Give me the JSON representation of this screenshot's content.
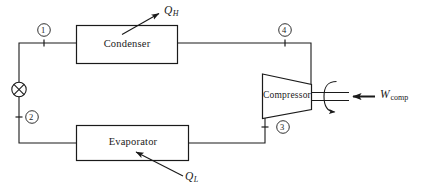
{
  "diagram": {
    "stroke_color": "#1a1a1a",
    "background_color": "#ffffff",
    "components": {
      "condenser": {
        "label": "Condenser"
      },
      "evaporator": {
        "label": "Evaporator"
      },
      "compressor": {
        "label": "Compressor"
      },
      "expansion_valve": {
        "icon": "circle-x-valve-icon"
      }
    },
    "state_points": [
      {
        "id": "1",
        "label": "1"
      },
      {
        "id": "2",
        "label": "2"
      },
      {
        "id": "3",
        "label": "3"
      },
      {
        "id": "4",
        "label": "4"
      }
    ],
    "energy_flows": [
      {
        "id": "q-h",
        "symbol": "Q",
        "subscript": "H",
        "direction": "out-of-condenser"
      },
      {
        "id": "q-l",
        "symbol": "Q",
        "subscript": "L",
        "direction": "into-evaporator"
      },
      {
        "id": "w-comp",
        "symbol": "W",
        "subscript": "comp",
        "direction": "into-compressor"
      }
    ]
  }
}
